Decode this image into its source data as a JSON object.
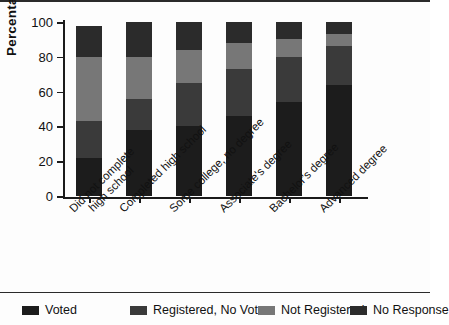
{
  "chart_data": {
    "type": "bar",
    "variant": "stacked-vertical",
    "title": "",
    "xlabel": "",
    "ylabel": "Percentage",
    "ylim": [
      0,
      100
    ],
    "yticks": [
      0,
      20,
      40,
      60,
      80,
      100
    ],
    "grid": false,
    "legend_position": "bottom",
    "categories": [
      "Did not complete\nhigh school",
      "Completed high school",
      "Some college, no degree",
      "Associate's degree",
      "Bachelor's degree",
      "Advanced degree"
    ],
    "series": [
      {
        "name": "Voted",
        "color": "#1c1c1c",
        "values": [
          22,
          38,
          40,
          46,
          54,
          64
        ]
      },
      {
        "name": "Registered, No Vote",
        "color": "#3a3a3a",
        "values": [
          21,
          18,
          25,
          27,
          26,
          22
        ]
      },
      {
        "name": "Not Registered",
        "color": "#777777",
        "values": [
          37,
          24,
          19,
          15,
          10,
          7
        ]
      },
      {
        "name": "No Response",
        "color": "#2b2b2b",
        "values": [
          18,
          20,
          16,
          12,
          10,
          7
        ]
      }
    ]
  },
  "axis": {
    "y_label": "Percentage",
    "tick_labels": [
      "100",
      "80",
      "60",
      "40",
      "20",
      "0"
    ]
  },
  "x_labels": [
    {
      "line1": "Did not complete",
      "line2": "high school"
    },
    {
      "line1": "Completed high school",
      "line2": ""
    },
    {
      "line1": "Some college, no degree",
      "line2": ""
    },
    {
      "line1": "Associate's degree",
      "line2": ""
    },
    {
      "line1": "Bachelor's degree",
      "line2": ""
    },
    {
      "line1": "Advanced degree",
      "line2": ""
    }
  ],
  "legend": {
    "items": [
      {
        "label": "Voted",
        "color": "#1c1c1c"
      },
      {
        "label": "Registered, No Vote",
        "color": "#3a3a3a"
      },
      {
        "label": "Not Registered",
        "color": "#777777"
      },
      {
        "label": "No Response",
        "color": "#2b2b2b"
      }
    ]
  }
}
